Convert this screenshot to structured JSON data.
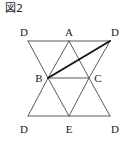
{
  "figure": {
    "caption": "図2",
    "caption_label": "Figure 2",
    "background_color": "#ffffff",
    "line_color": "#5a5a5a",
    "bold_line_color": "#171717",
    "label_color": "#1a1a1a",
    "thin_line_width": 1,
    "bold_line_width": 2
  },
  "chart_data": {
    "type": "diagram",
    "title": "図2",
    "points": [
      {
        "id": "D_topleft",
        "label": "D",
        "x": 28,
        "y": 41,
        "label_x": 24,
        "label_y": 36
      },
      {
        "id": "A",
        "label": "A",
        "x": 69,
        "y": 41,
        "label_x": 69,
        "label_y": 36
      },
      {
        "id": "D_topright",
        "label": "D",
        "x": 110,
        "y": 41,
        "label_x": 115,
        "label_y": 36
      },
      {
        "id": "B",
        "label": "B",
        "x": 48,
        "y": 78,
        "label_x": 39,
        "label_y": 82
      },
      {
        "id": "C",
        "label": "C",
        "x": 89,
        "y": 78,
        "label_x": 98,
        "label_y": 82
      },
      {
        "id": "D_bottomleft",
        "label": "D",
        "x": 28,
        "y": 116,
        "label_x": 24,
        "label_y": 133
      },
      {
        "id": "E",
        "label": "E",
        "x": 69,
        "y": 116,
        "label_x": 69,
        "label_y": 133
      },
      {
        "id": "D_bottomright",
        "label": "D",
        "x": 110,
        "y": 116,
        "label_x": 115,
        "label_y": 133
      }
    ],
    "segments": [
      {
        "id": "rail-top",
        "from": "D_topleft",
        "to": "D_topright",
        "style": "thin"
      },
      {
        "id": "rail-middle",
        "from": "B",
        "to": "C",
        "style": "thin"
      },
      {
        "id": "rail-bottom",
        "from": "D_bottomleft",
        "to": "D_bottomright",
        "style": "thin"
      },
      {
        "id": "upper-dl-b",
        "from": "D_topleft",
        "to": "B",
        "style": "thin"
      },
      {
        "id": "upper-b-a",
        "from": "B",
        "to": "A",
        "style": "thin"
      },
      {
        "id": "upper-a-c",
        "from": "A",
        "to": "C",
        "style": "thin"
      },
      {
        "id": "upper-c-dr",
        "from": "C",
        "to": "D_topright",
        "style": "thin"
      },
      {
        "id": "lower-b-dbl",
        "from": "B",
        "to": "D_bottomleft",
        "style": "thin"
      },
      {
        "id": "lower-b-e",
        "from": "B",
        "to": "E",
        "style": "thin"
      },
      {
        "id": "lower-e-c",
        "from": "E",
        "to": "C",
        "style": "thin"
      },
      {
        "id": "lower-c-dbr",
        "from": "C",
        "to": "D_bottomright",
        "style": "thin"
      },
      {
        "id": "diagonal-b-dr",
        "from": "B",
        "to": "D_topright",
        "style": "bold"
      }
    ],
    "xlim": [
      0,
      131
    ],
    "ylim": [
      0,
      146
    ],
    "grid": false,
    "legend": null
  }
}
